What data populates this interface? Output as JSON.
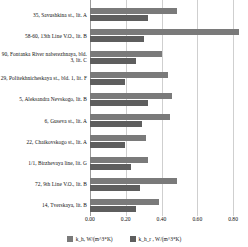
{
  "chart_data": {
    "type": "bar",
    "orientation": "horizontal",
    "title": "",
    "xlabel": "",
    "ylabel": "",
    "xlim": [
      0.0,
      0.85
    ],
    "grid": true,
    "legend_position": "bottom",
    "xticks": [
      "0.00",
      "0.20",
      "0.40",
      "0.60",
      "0.80"
    ],
    "xtick_values": [
      0.0,
      0.2,
      0.4,
      0.6,
      0.8
    ],
    "categories": [
      "35, Savushkina st., lit. A",
      "58-60, 13th Line V.O., lit. B",
      "90, Fontanka River naberezhnaya, bld. 3, lit. C",
      "29, Politekhnicheskaya st., bld. 1, lit. F",
      "5, Aleksandra Nevskogo, lit. B",
      "6, Guseva st., lit. A",
      "22, Chaikovskogo st., lit. A",
      "1/1, Birzhevaya line, lit. G",
      "72, 9th Line V.O., lit. B",
      "14, Tverskaya, lit. B"
    ],
    "series": [
      {
        "name": "k_h, W/(m^3*K)",
        "color": "#7a7a7a",
        "values": [
          0.47,
          0.8,
          0.39,
          0.42,
          0.44,
          0.43,
          0.3,
          0.31,
          0.47,
          0.37
        ]
      },
      {
        "name": "k_h_r , W/(m^3*K)",
        "color": "#5e5e5e",
        "values": [
          0.31,
          0.29,
          0.25,
          0.19,
          0.31,
          0.28,
          0.19,
          0.22,
          0.27,
          0.25
        ]
      }
    ]
  },
  "legend": {
    "items": [
      {
        "label": "k_h, W/(m^3*K)"
      },
      {
        "label": "k_h_r , W/(m^3*K)"
      }
    ]
  }
}
